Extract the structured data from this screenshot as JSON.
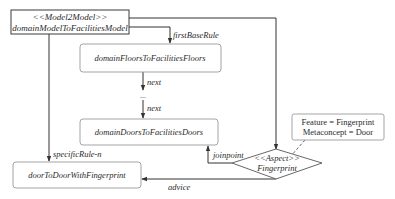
{
  "diagram": {
    "root": {
      "stereotype": "<<Model2Model>>",
      "name": "domainModelToFacilitiesModel"
    },
    "nodes": {
      "floors": "domainFloorsToFacilitiesFloors",
      "doors": "domainDoorsToFacilitiesDoors",
      "door_fp": "doorToDoorWithFingerprint"
    },
    "aspect": {
      "stereotype": "<<Aspect>>",
      "name": "Fingerprint"
    },
    "note": {
      "line1": "Feature = Fingerprint",
      "line2": "Metaconcept = Door"
    },
    "edges": {
      "first_base_rule": "firstBaseRule",
      "next1": "next",
      "ellipsis": "...",
      "next2": "next",
      "specific_rule": "specificRule-n",
      "joinpoint": "joinpoint",
      "advice": "advice"
    }
  }
}
